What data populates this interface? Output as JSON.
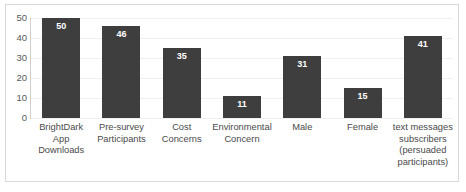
{
  "chart_data": {
    "type": "bar",
    "title": "",
    "xlabel": "",
    "ylabel": "",
    "ylim": [
      0,
      50
    ],
    "yticks": [
      "0",
      "10",
      "20",
      "30",
      "40",
      "50"
    ],
    "grid": true,
    "legend": "none",
    "orientation": "vertical",
    "bar_color": "#3e3e3e",
    "categories": [
      "BrightDark\nApp\nDownloads",
      "Pre-survey\nParticipants",
      "Cost Concerns",
      "Environmental\nConcern",
      "Male",
      "Female",
      "text messages\nsubscribers\n(persuaded\nparticipants)"
    ],
    "values": [
      50,
      46,
      35,
      11,
      31,
      15,
      41
    ],
    "value_labels": [
      "50",
      "46",
      "35",
      "11",
      "31",
      "15",
      "41"
    ]
  }
}
